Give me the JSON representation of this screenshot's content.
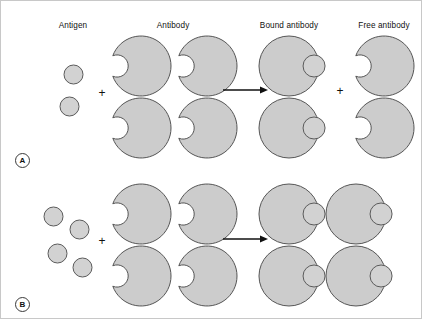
{
  "figure": {
    "title_columns": [
      {
        "label": "Antigen",
        "x": 72,
        "y": 20
      },
      {
        "label": "Antibody",
        "x": 172,
        "y": 20
      },
      {
        "label": "Bound antibody",
        "x": 288,
        "y": 20
      },
      {
        "label": "Free antibody",
        "x": 383,
        "y": 20
      }
    ],
    "colors": {
      "shape_fill": "#cccccc",
      "shape_stroke": "#555555",
      "antigen_fill": "#d2d2d2",
      "antigen_stroke": "#5a5a5a",
      "text": "#111111",
      "background": "#ffffff",
      "arrow": "#111111",
      "border": "#c8c8c8"
    },
    "operators": [
      {
        "symbol": "+",
        "x": 101,
        "y": 92,
        "name": "plus-operator-panel-a-reactants"
      },
      {
        "symbol": "+",
        "x": 339,
        "y": 90,
        "name": "plus-operator-panel-a-products"
      },
      {
        "symbol": "+",
        "x": 101,
        "y": 240,
        "name": "plus-operator-panel-b-reactants"
      }
    ],
    "arrows": [
      {
        "x": 222,
        "y": 89,
        "width": 45,
        "name": "reaction-arrow-panel-a"
      },
      {
        "x": 222,
        "y": 238,
        "width": 45,
        "name": "reaction-arrow-panel-b"
      }
    ],
    "panels": [
      {
        "id": "A",
        "label": "A",
        "label_x": 14,
        "label_y": 152,
        "antigens": [
          {
            "cx": 72,
            "cy": 73,
            "r": 9.5
          },
          {
            "cx": 68,
            "cy": 105,
            "r": 9.5
          }
        ],
        "free_antibodies_input": [
          {
            "cx": 140,
            "cy": 65,
            "r": 30
          },
          {
            "cx": 206,
            "cy": 65,
            "r": 30
          },
          {
            "cx": 140,
            "cy": 127,
            "r": 30
          },
          {
            "cx": 206,
            "cy": 127,
            "r": 30
          }
        ],
        "bound_antibodies": [
          {
            "cx": 288,
            "cy": 65,
            "r": 30,
            "antigen_r": 11
          },
          {
            "cx": 288,
            "cy": 127,
            "r": 30,
            "antigen_r": 11
          }
        ],
        "free_antibodies_output": [
          {
            "cx": 383,
            "cy": 65,
            "r": 30
          },
          {
            "cx": 383,
            "cy": 127,
            "r": 30
          }
        ]
      },
      {
        "id": "B",
        "label": "B",
        "label_x": 14,
        "label_y": 296,
        "antigens": [
          {
            "cx": 52,
            "cy": 215,
            "r": 9.5
          },
          {
            "cx": 78,
            "cy": 228,
            "r": 9.5
          },
          {
            "cx": 56,
            "cy": 252,
            "r": 9.5
          },
          {
            "cx": 81,
            "cy": 266,
            "r": 9.5
          }
        ],
        "free_antibodies_input": [
          {
            "cx": 140,
            "cy": 213,
            "r": 30
          },
          {
            "cx": 206,
            "cy": 213,
            "r": 30
          },
          {
            "cx": 140,
            "cy": 275,
            "r": 30
          },
          {
            "cx": 206,
            "cy": 275,
            "r": 30
          }
        ],
        "bound_antibodies": [
          {
            "cx": 288,
            "cy": 213,
            "r": 30,
            "antigen_r": 11
          },
          {
            "cx": 355,
            "cy": 213,
            "r": 30,
            "antigen_r": 11
          },
          {
            "cx": 288,
            "cy": 275,
            "r": 30,
            "antigen_r": 11
          },
          {
            "cx": 355,
            "cy": 275,
            "r": 30,
            "antigen_r": 11
          }
        ],
        "free_antibodies_output": []
      }
    ]
  }
}
